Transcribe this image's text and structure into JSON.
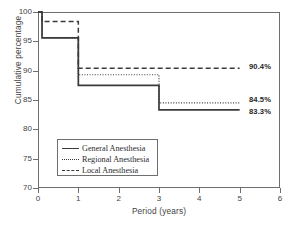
{
  "chart_data": {
    "type": "line",
    "subtype": "step",
    "title": "",
    "xlabel": "Period (years)",
    "ylabel": "Cumulative percentage",
    "xlim": [
      0,
      6
    ],
    "ylim": [
      70,
      100
    ],
    "xticks": [
      0,
      1,
      2,
      3,
      4,
      5,
      6
    ],
    "yticks": [
      70,
      75,
      80,
      85,
      90,
      95,
      100
    ],
    "xtick_labels": [
      "0",
      "1",
      "2",
      "3",
      "4",
      "5",
      "6"
    ],
    "ytick_labels": [
      "70",
      "75",
      "80",
      "85",
      "90",
      "95",
      "100"
    ],
    "grid": false,
    "legend_position": "lower-left-inside",
    "series": [
      {
        "name": "General Anesthesia",
        "style": "solid",
        "color": "#3a3a3a",
        "steps": [
          {
            "x": 0.0,
            "y": 100.0
          },
          {
            "x": 0.1,
            "y": 95.6
          },
          {
            "x": 1.0,
            "y": 87.5
          },
          {
            "x": 3.0,
            "y": 83.3
          },
          {
            "x": 5.0,
            "y": 83.3
          }
        ],
        "end_value": 83.3,
        "end_label": "83.3%"
      },
      {
        "name": "Regional Anesthesia",
        "style": "dotted",
        "color": "#3a3a3a",
        "steps": [
          {
            "x": 0.0,
            "y": 100.0
          },
          {
            "x": 0.1,
            "y": 95.6
          },
          {
            "x": 1.0,
            "y": 89.3
          },
          {
            "x": 3.0,
            "y": 84.5
          },
          {
            "x": 5.0,
            "y": 84.5
          }
        ],
        "end_value": 84.5,
        "end_label": "84.5%"
      },
      {
        "name": "Local Anesthesia",
        "style": "dashed",
        "color": "#3a3a3a",
        "steps": [
          {
            "x": 0.0,
            "y": 100.0
          },
          {
            "x": 0.1,
            "y": 98.4
          },
          {
            "x": 1.0,
            "y": 90.4
          },
          {
            "x": 5.0,
            "y": 90.4
          }
        ],
        "end_value": 90.4,
        "end_label": "90.4%"
      }
    ],
    "annotations": [
      {
        "text": "90.4%",
        "x": 5.1,
        "y": 90.4
      },
      {
        "text": "84.5%",
        "x": 5.1,
        "y": 84.5
      },
      {
        "text": "83.3%",
        "x": 5.1,
        "y": 83.3
      }
    ]
  },
  "legend": {
    "entries": [
      {
        "label": "General Anesthesia",
        "style": "solid"
      },
      {
        "label": "Regional Anesthesia",
        "style": "dotted"
      },
      {
        "label": "Local Anesthesia",
        "style": "dashed"
      }
    ]
  },
  "caption_sliver": ""
}
